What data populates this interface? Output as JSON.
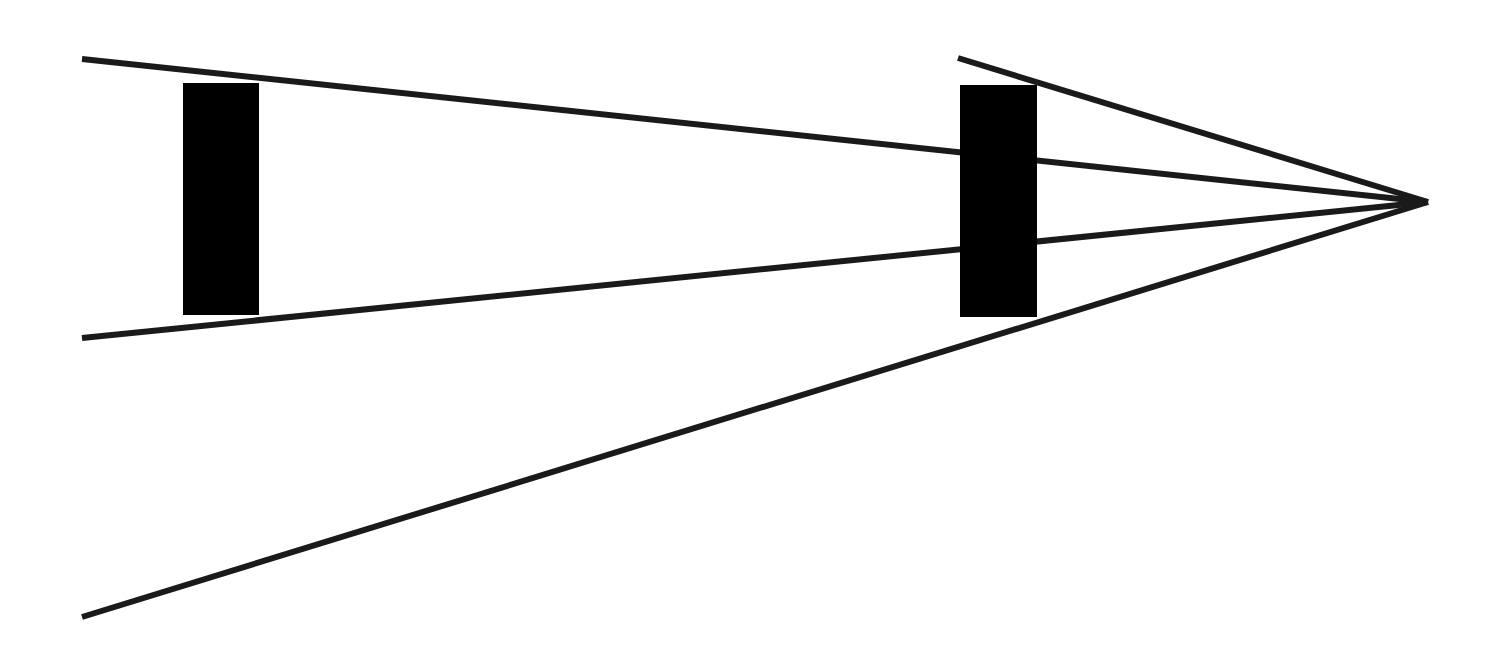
{
  "diagram": {
    "type": "converging-lines-with-bars",
    "background": "#ffffff",
    "stroke_color": "#1a1a1a",
    "fill_color": "#000000",
    "stroke_width": 6,
    "vanishing_point": {
      "x": 1428,
      "y": 202
    },
    "lines": [
      {
        "name": "upper-inner-line",
        "x1": 82,
        "y1": 59,
        "x2": 1428,
        "y2": 202
      },
      {
        "name": "lower-inner-line",
        "x1": 82,
        "y1": 338,
        "x2": 1428,
        "y2": 202
      },
      {
        "name": "upper-outer-line",
        "x1": 958,
        "y1": 58,
        "x2": 1428,
        "y2": 202
      },
      {
        "name": "lower-outer-line",
        "x1": 82,
        "y1": 617,
        "x2": 1428,
        "y2": 202
      }
    ],
    "bars": [
      {
        "name": "left-bar",
        "x": 183,
        "y": 83,
        "width": 76,
        "height": 232
      },
      {
        "name": "right-bar",
        "x": 960,
        "y": 85,
        "width": 77,
        "height": 232
      }
    ]
  }
}
